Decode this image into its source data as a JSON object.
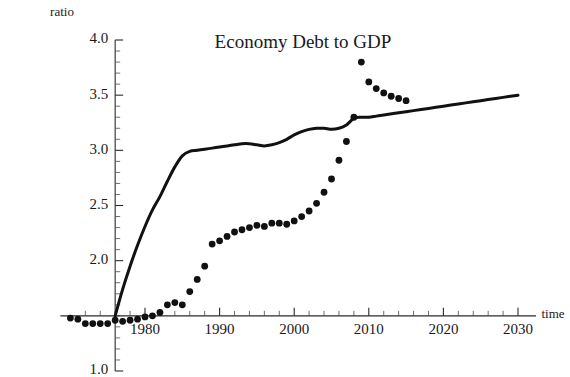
{
  "chart_data": {
    "type": "line",
    "title": "Economy Debt to GDP",
    "xlabel": "time",
    "ylabel": "ratio",
    "grid": false,
    "legend": "none",
    "xlim": [
      1970,
      2030
    ],
    "ylim": [
      1.0,
      4.0
    ],
    "x_ticks_major": [
      1980,
      1990,
      2000,
      2010,
      2020,
      2030
    ],
    "x_tick_labels": [
      "1980",
      "1990",
      "2000",
      "2010",
      "2020",
      "2030"
    ],
    "x_tick_minor_step": 2,
    "y_ticks_major": [
      1.0,
      2.0,
      2.5,
      3.0,
      3.5,
      4.0
    ],
    "y_tick_labels": [
      "1.0",
      "2.0",
      "2.5",
      "3.0",
      "3.5",
      "4.0"
    ],
    "y_tick_minor_step": 0.1,
    "axis_origin_y_value": 1.5,
    "axis_origin_x_value": 1976,
    "series": [
      {
        "name": "trend-line",
        "style": "line",
        "x": [
          1976.0,
          1977.0,
          1978.0,
          1979.0,
          1980.0,
          1981.0,
          1982.0,
          1983.0,
          1984.0,
          1985.0,
          1986.0,
          1987.0,
          1988.0,
          1989.0,
          1990.0,
          1991.0,
          1992.0,
          1993.0,
          1994.0,
          1995.0,
          1996.0,
          1997.0,
          1998.0,
          1999.0,
          2000.0,
          2001.0,
          2002.0,
          2003.0,
          2004.0,
          2005.0,
          2006.0,
          2007.0,
          2008.0,
          2009.0,
          2010.0,
          2011.0,
          2012.0,
          2014.0,
          2016.0,
          2018.0,
          2020.0,
          2022.0,
          2024.0,
          2026.0,
          2028.0,
          2030.0
        ],
        "y": [
          1.5,
          1.74,
          1.95,
          2.14,
          2.31,
          2.46,
          2.58,
          2.72,
          2.85,
          2.95,
          2.99,
          3.0,
          3.01,
          3.02,
          3.03,
          3.04,
          3.05,
          3.06,
          3.06,
          3.05,
          3.04,
          3.05,
          3.07,
          3.1,
          3.14,
          3.17,
          3.19,
          3.2,
          3.2,
          3.19,
          3.2,
          3.23,
          3.29,
          3.3,
          3.3,
          3.31,
          3.32,
          3.34,
          3.36,
          3.38,
          3.4,
          3.42,
          3.44,
          3.46,
          3.48,
          3.5
        ]
      },
      {
        "name": "data-points",
        "style": "scatter",
        "x": [
          1970.0,
          1971.0,
          1972.0,
          1973.0,
          1974.0,
          1975.0,
          1976.0,
          1977.0,
          1978.0,
          1979.0,
          1980.0,
          1981.0,
          1982.0,
          1983.0,
          1984.0,
          1985.0,
          1986.0,
          1987.0,
          1988.0,
          1989.0,
          1990.0,
          1991.0,
          1992.0,
          1993.0,
          1994.0,
          1995.0,
          1996.0,
          1997.0,
          1998.0,
          1999.0,
          2000.0,
          2001.0,
          2002.0,
          2003.0,
          2004.0,
          2005.0,
          2006.0,
          2007.0,
          2008.0,
          2009.0,
          2010.0,
          2011.0,
          2012.0,
          2013.0,
          2014.0,
          2015.0
        ],
        "y": [
          1.48,
          1.47,
          1.43,
          1.43,
          1.43,
          1.43,
          1.46,
          1.45,
          1.46,
          1.47,
          1.49,
          1.5,
          1.53,
          1.6,
          1.62,
          1.6,
          1.72,
          1.83,
          1.95,
          2.15,
          2.18,
          2.22,
          2.26,
          2.28,
          2.3,
          2.32,
          2.31,
          2.34,
          2.34,
          2.33,
          2.36,
          2.4,
          2.45,
          2.52,
          2.62,
          2.74,
          2.91,
          3.08,
          3.3,
          3.8,
          3.62,
          3.56,
          3.52,
          3.49,
          3.47,
          3.45
        ]
      }
    ]
  },
  "labels": {
    "title": "Economy Debt to GDP",
    "y_axis_name": "ratio",
    "x_axis_name": "time"
  }
}
